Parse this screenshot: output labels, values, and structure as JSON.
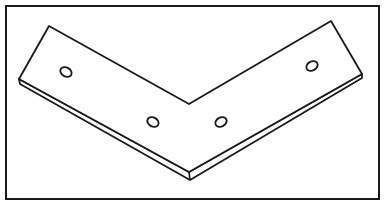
{
  "figure": {
    "colors": {
      "background": "#ffffff",
      "stroke": "#1a1a1a"
    },
    "frame": {
      "x": 6,
      "y": 6,
      "width": 373,
      "height": 193
    },
    "bracket": {
      "top_face": [
        [
          49,
          26
        ],
        [
          189,
          104
        ],
        [
          331,
          21
        ],
        [
          362,
          74
        ],
        [
          189,
          172
        ],
        [
          19,
          79
        ]
      ],
      "front_edge": [
        [
          19,
          79
        ],
        [
          189,
          172
        ],
        [
          362,
          74
        ],
        [
          362,
          78
        ],
        [
          190,
          180
        ],
        [
          20,
          84
        ]
      ],
      "corner_edge": [
        [
          189,
          172
        ],
        [
          190,
          180
        ]
      ]
    },
    "holes": [
      {
        "cx": 66,
        "cy": 72,
        "rx": 6,
        "ry": 4.5,
        "rotate": 30
      },
      {
        "cx": 153,
        "cy": 122,
        "rx": 6,
        "ry": 4.5,
        "rotate": 30
      },
      {
        "cx": 221,
        "cy": 122,
        "rx": 6,
        "ry": 4.5,
        "rotate": -30
      },
      {
        "cx": 312,
        "cy": 66,
        "rx": 6,
        "ry": 4.5,
        "rotate": -30
      }
    ]
  }
}
